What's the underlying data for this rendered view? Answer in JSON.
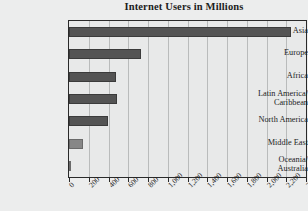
{
  "chart_data": {
    "type": "bar",
    "orientation": "horizontal",
    "title": "Internet Users in Millions",
    "xlabel": "",
    "ylabel": "",
    "xlim": [
      0,
      2400
    ],
    "grid": true,
    "legend": false,
    "categories": [
      "Asia",
      "Europe",
      "Africa",
      "Latin America/\nCaribbean",
      "North America",
      "Middle East",
      "Oceania/\nAustralia"
    ],
    "values": [
      2250,
      730,
      480,
      490,
      390,
      140,
      25
    ],
    "xticks": [
      0,
      200,
      400,
      600,
      800,
      1000,
      1200,
      1400,
      1600,
      1800,
      2000,
      2200,
      2400
    ],
    "xtick_labels": [
      "0",
      "200",
      "400",
      "600",
      "800",
      "1,000",
      "1,200",
      "1,400",
      "1,600",
      "1,800",
      "2,000",
      "2,200",
      "2,400"
    ],
    "bar_color": "#545454",
    "background_color": "#eceded",
    "plot_background_color": "#e8e9e9",
    "gridline_color": "#b9bbbb",
    "axis_color": "#2a2a2a"
  }
}
